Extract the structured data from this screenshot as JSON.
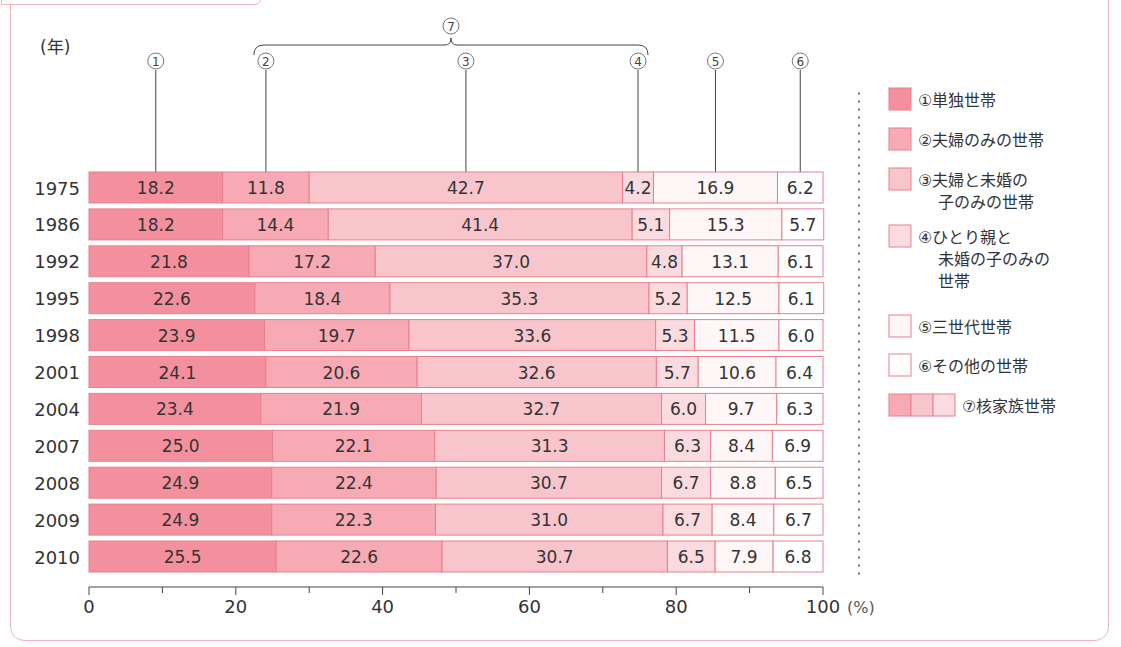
{
  "header": {
    "caption": "るか考えてみよう."
  },
  "colors": {
    "seg1": "#f4909e",
    "seg2": "#f7a9b4",
    "seg3": "#f9c5cd",
    "seg4": "#fadbe0",
    "seg5": "#fff6f7",
    "seg6": "#ffffff",
    "border": "#e8808f",
    "text": "#333333"
  },
  "chart_data": {
    "type": "bar",
    "orientation": "horizontal",
    "stacked": true,
    "title": "",
    "ylabel": "(年)",
    "xlabel": "(%)",
    "xlim": [
      0,
      100
    ],
    "xticks": [
      0,
      20,
      40,
      60,
      80,
      100
    ],
    "xminor_ticks": [
      10,
      30,
      50,
      70,
      90
    ],
    "categories": [
      "1975",
      "1986",
      "1992",
      "1995",
      "1998",
      "2001",
      "2004",
      "2007",
      "2008",
      "2009",
      "2010"
    ],
    "series": [
      {
        "name": "①単独世帯",
        "marker": "①",
        "values": [
          18.2,
          18.2,
          21.8,
          22.6,
          23.9,
          24.1,
          23.4,
          25.0,
          24.9,
          24.9,
          25.5
        ]
      },
      {
        "name": "②夫婦のみの世帯",
        "marker": "②",
        "values": [
          11.8,
          14.4,
          17.2,
          18.4,
          19.7,
          20.6,
          21.9,
          22.1,
          22.4,
          22.3,
          22.6
        ]
      },
      {
        "name": "③夫婦と未婚の子のみの世帯",
        "marker": "③",
        "values": [
          42.7,
          41.4,
          37.0,
          35.3,
          33.6,
          32.6,
          32.7,
          31.3,
          30.7,
          31.0,
          30.7
        ]
      },
      {
        "name": "④ひとり親と未婚の子のみの世帯",
        "marker": "④",
        "values": [
          4.2,
          5.1,
          4.8,
          5.2,
          5.3,
          5.7,
          6.0,
          6.3,
          6.7,
          6.7,
          6.5
        ]
      },
      {
        "name": "⑤三世代世帯",
        "marker": "⑤",
        "values": [
          16.9,
          15.3,
          13.1,
          12.5,
          11.5,
          10.6,
          9.7,
          8.4,
          8.8,
          8.4,
          7.9
        ]
      },
      {
        "name": "⑥その他の世帯",
        "marker": "⑥",
        "values": [
          6.2,
          5.7,
          6.1,
          6.1,
          6.0,
          6.4,
          6.3,
          6.9,
          6.5,
          6.7,
          6.8
        ]
      }
    ],
    "group_annotation": {
      "marker": "⑦",
      "label": "⑦核家族世帯",
      "spans": [
        "②",
        "④"
      ]
    },
    "legend": {
      "placement": "right",
      "entries": [
        {
          "lines": [
            "①単独世帯"
          ]
        },
        {
          "lines": [
            "②夫婦のみの世帯"
          ]
        },
        {
          "lines": [
            "③夫婦と未婚の",
            "子のみの世帯"
          ]
        },
        {
          "lines": [
            "④ひとり親と",
            "未婚の子のみの",
            "世帯"
          ]
        },
        {
          "lines": [
            "⑤三世代世帯"
          ]
        },
        {
          "lines": [
            "⑥その他の世帯"
          ]
        },
        {
          "lines": [
            "⑦核家族世帯"
          ]
        }
      ]
    },
    "grid": false
  }
}
